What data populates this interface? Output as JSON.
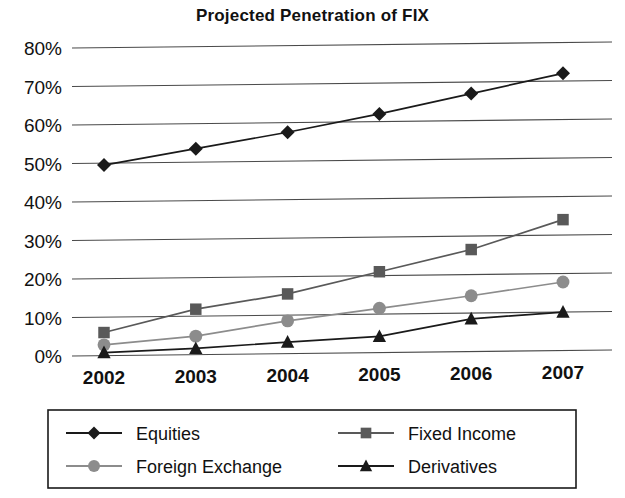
{
  "chart_data": {
    "type": "line",
    "title": "Projected Penetration of FIX",
    "xlabel": "",
    "ylabel": "",
    "categories": [
      "2002",
      "2003",
      "2004",
      "2005",
      "2006",
      "2007"
    ],
    "ylim": [
      0,
      80
    ],
    "ytick_labels": [
      "0%",
      "10%",
      "20%",
      "30%",
      "40%",
      "50%",
      "60%",
      "70%",
      "80%"
    ],
    "ytick_values": [
      0,
      10,
      20,
      30,
      40,
      50,
      60,
      70,
      80
    ],
    "grid": "horizontal",
    "legend_position": "bottom",
    "series": [
      {
        "name": "Equities",
        "marker": "diamond",
        "color": "#1a1a1a",
        "values": [
          49.5,
          53.5,
          57.5,
          62,
          67,
          72
        ]
      },
      {
        "name": "Fixed Income",
        "marker": "square",
        "color": "#595959",
        "values": [
          6,
          11.8,
          15.5,
          21,
          26.5,
          34
        ]
      },
      {
        "name": "Foreign Exchange",
        "marker": "circle",
        "color": "#8c8c8c",
        "values": [
          2.8,
          4.8,
          8.5,
          11.5,
          14.5,
          17.8
        ]
      },
      {
        "name": "Derivatives",
        "marker": "triangle",
        "color": "#1a1a1a",
        "values": [
          0.8,
          1.6,
          3,
          4.2,
          8.5,
          10
        ]
      }
    ]
  },
  "legend": {
    "entries": [
      {
        "label": "Equities",
        "marker": "diamond-marker",
        "color": "#1a1a1a"
      },
      {
        "label": "Fixed Income",
        "marker": "square-marker",
        "color": "#595959"
      },
      {
        "label": "Foreign Exchange",
        "marker": "circle-marker",
        "color": "#8c8c8c"
      },
      {
        "label": "Derivatives",
        "marker": "triangle-marker",
        "color": "#1a1a1a"
      }
    ]
  }
}
